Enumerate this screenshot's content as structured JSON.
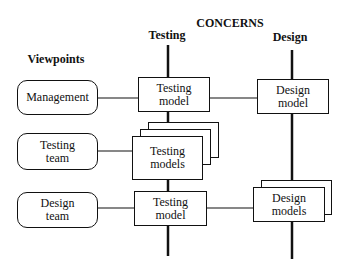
{
  "diagram": {
    "header": "CONCERNS",
    "viewpoints_heading": "Viewpoints",
    "concerns": [
      {
        "id": "testing",
        "label": "Testing"
      },
      {
        "id": "design",
        "label": "Design"
      }
    ],
    "viewpoints": [
      {
        "id": "management",
        "line1": "Management",
        "line2": ""
      },
      {
        "id": "testing-team",
        "line1": "Testing",
        "line2": "team"
      },
      {
        "id": "design-team",
        "line1": "Design",
        "line2": "team"
      }
    ],
    "models": {
      "management_testing": {
        "line1": "Testing",
        "line2": "model"
      },
      "management_design": {
        "line1": "Design",
        "line2": "model"
      },
      "testing_team_testing": {
        "line1": "Testing",
        "line2": "models"
      },
      "design_team_testing": {
        "line1": "Testing",
        "line2": "model"
      },
      "design_team_design": {
        "line1": "Design",
        "line2": "models"
      }
    }
  }
}
